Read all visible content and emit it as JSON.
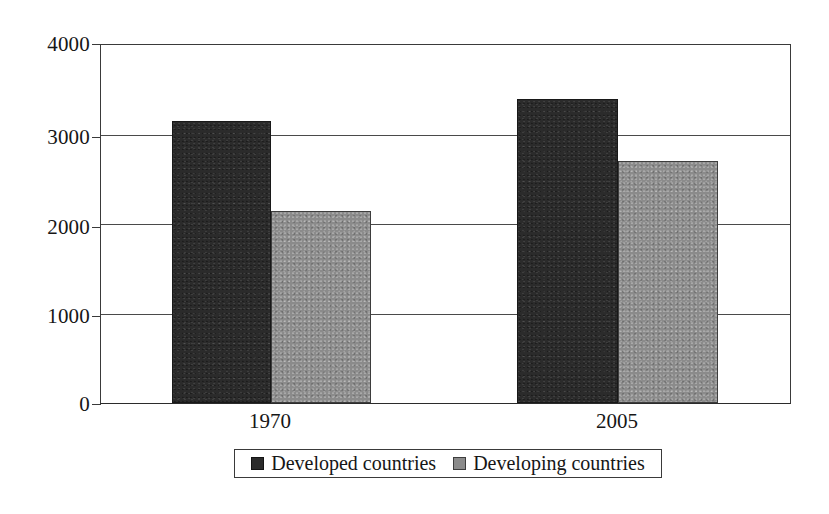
{
  "chart_data": {
    "type": "bar",
    "title": "",
    "subtitle": "",
    "xlabel": "",
    "ylabel": "",
    "categories": [
      "1970",
      "2005"
    ],
    "series": [
      {
        "name": "Developed countries",
        "values": [
          3150,
          3400
        ],
        "color": "#2b2b2b"
      },
      {
        "name": "Developing countries",
        "values": [
          2150,
          2700
        ],
        "color": "#8b8b8b"
      }
    ],
    "ylim": [
      0,
      4000
    ],
    "yticks": [
      0,
      1000,
      2000,
      3000,
      4000
    ],
    "ytick_labels": [
      "0",
      "1000",
      "2000",
      "3000",
      "4000"
    ],
    "grid": "horizontal",
    "legend_position": "bottom",
    "annotations": []
  },
  "axes": {
    "y": {
      "ticks": [
        {
          "label": "4000",
          "value": 4000
        },
        {
          "label": "3000",
          "value": 3000
        },
        {
          "label": "2000",
          "value": 2000
        },
        {
          "label": "1000",
          "value": 1000
        },
        {
          "label": "0",
          "value": 0
        }
      ]
    },
    "x": {
      "ticks": [
        {
          "label": "1970"
        },
        {
          "label": "2005"
        }
      ]
    }
  },
  "legend": {
    "entries": [
      {
        "label": "Developed countries",
        "swatch": "dark-swatch-icon"
      },
      {
        "label": "Developing countries",
        "swatch": "light-swatch-icon"
      }
    ]
  },
  "colors": {
    "series_developed": "#2b2b2b",
    "series_developing": "#8b8b8b",
    "axis": "#3a3a3a",
    "background": "#ffffff"
  }
}
